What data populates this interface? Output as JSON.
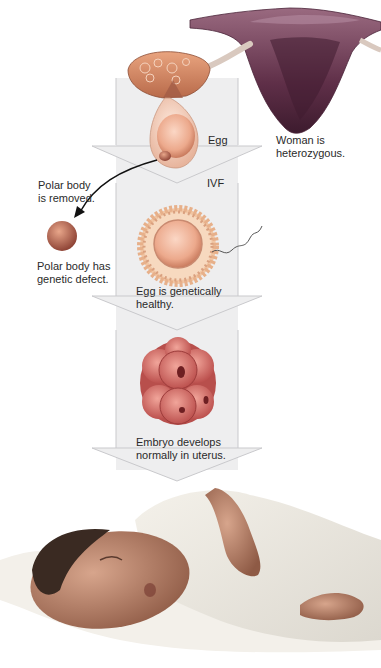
{
  "diagram": {
    "colors": {
      "arrow_fill": "#eeeeef",
      "arrow_stroke": "#c9c9cc",
      "uterus": "#7d4a64",
      "ovary": "#d98a62",
      "egg": "#f0b59c",
      "embryo": "#d9736c",
      "polar_body": "#b8614f",
      "text": "#2a2a2a"
    },
    "labels": {
      "egg": "Egg",
      "woman": "Woman is\nheterozygous.",
      "ivf": "IVF",
      "polar_removed": "Polar body\nis removed.",
      "polar_defect": "Polar body has\ngenetic defect.",
      "egg_healthy": "Egg is genetically\nhealthy.",
      "embryo": "Embryo develops\nnormally in uterus."
    },
    "stages": [
      {
        "name": "ovary-and-egg",
        "label": "Egg"
      },
      {
        "name": "ivf-fertilization",
        "label": "IVF"
      },
      {
        "name": "embryo",
        "label": "Embryo develops normally in uterus."
      },
      {
        "name": "baby",
        "label": ""
      }
    ]
  }
}
